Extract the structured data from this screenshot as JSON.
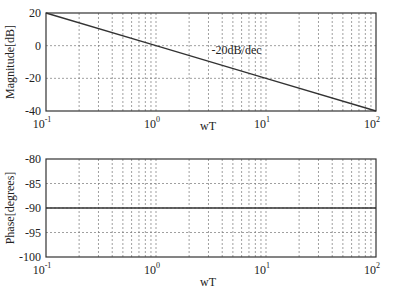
{
  "chart_data": [
    {
      "type": "line",
      "title": "",
      "xlabel": "wT",
      "ylabel": "Magnitude[dB]",
      "xscale": "log",
      "xlim": [
        0.1,
        100
      ],
      "ylim": [
        -40,
        20
      ],
      "xticks": [
        0.1,
        1,
        10,
        100
      ],
      "xtick_labels": [
        {
          "base": "10",
          "exp": "-1"
        },
        {
          "base": "10",
          "exp": "0"
        },
        {
          "base": "10",
          "exp": "1"
        },
        {
          "base": "10",
          "exp": "2"
        }
      ],
      "yticks": [
        20,
        0,
        -20,
        -40
      ],
      "ytick_labels": [
        "20",
        "0",
        "-20",
        "-40"
      ],
      "grid": true,
      "series": [
        {
          "name": "magnitude",
          "x": [
            0.1,
            1,
            10,
            100
          ],
          "y": [
            20,
            0,
            -20,
            -40
          ]
        }
      ],
      "annotations": [
        {
          "text": "-20dB/dec",
          "x": 3.2,
          "y": -5
        }
      ]
    },
    {
      "type": "line",
      "title": "",
      "xlabel": "wT",
      "ylabel": "Phase[degrees]",
      "xscale": "log",
      "xlim": [
        0.1,
        100
      ],
      "ylim": [
        -100,
        -80
      ],
      "xticks": [
        0.1,
        1,
        10,
        100
      ],
      "xtick_labels": [
        {
          "base": "10",
          "exp": "-1"
        },
        {
          "base": "10",
          "exp": "0"
        },
        {
          "base": "10",
          "exp": "1"
        },
        {
          "base": "10",
          "exp": "2"
        }
      ],
      "yticks": [
        -80,
        -85,
        -90,
        -95,
        -100
      ],
      "ytick_labels": [
        "-80",
        "-85",
        "-90",
        "-95",
        "-100"
      ],
      "grid": true,
      "series": [
        {
          "name": "phase",
          "x": [
            0.1,
            100
          ],
          "y": [
            -90,
            -90
          ]
        }
      ],
      "annotations": []
    }
  ],
  "layout": {
    "panels": [
      {
        "left": 46,
        "top": 13,
        "right": 376,
        "bottom": 111,
        "xlabel_y": 130,
        "ylabel_x": 14
      },
      {
        "left": 46,
        "top": 159,
        "right": 376,
        "bottom": 257,
        "xlabel_y": 286,
        "ylabel_x": 14
      }
    ]
  }
}
